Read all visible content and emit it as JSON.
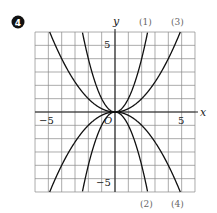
{
  "badge": {
    "number": "4",
    "color": "#111111"
  },
  "chart_data": {
    "type": "line",
    "title": "",
    "xlabel": "x",
    "ylabel": "y",
    "origin_label": "O",
    "xlim": [
      -6,
      6
    ],
    "ylim": [
      -6,
      6
    ],
    "grid": true,
    "x_ticks_labeled": [
      {
        "value": -5,
        "label": "−5"
      },
      {
        "value": 5,
        "label": "5"
      }
    ],
    "y_ticks_labeled": [
      {
        "value": 5,
        "label": "5"
      },
      {
        "value": -5,
        "label": "−5"
      }
    ],
    "series": [
      {
        "name": "(1)",
        "equation": "y = x^2",
        "a": 1,
        "label_position": "top"
      },
      {
        "name": "(2)",
        "equation": "y = -x^2",
        "a": -1,
        "label_position": "bottom"
      },
      {
        "name": "(3)",
        "equation": "y = x^2/4",
        "a": 0.25,
        "label_position": "top"
      },
      {
        "name": "(4)",
        "equation": "y = -x^2/4",
        "a": -0.25,
        "label_position": "bottom"
      }
    ],
    "line_color": "#111111",
    "grid_color": "#888888"
  },
  "labels": {
    "x_axis": "x",
    "y_axis": "y",
    "origin": "O",
    "x_neg5": "−5",
    "x_pos5": "5",
    "y_pos5": "5",
    "y_neg5": "−5",
    "curve1": "(1)",
    "curve2": "(2)",
    "curve3": "(3)",
    "curve4": "(4)"
  }
}
